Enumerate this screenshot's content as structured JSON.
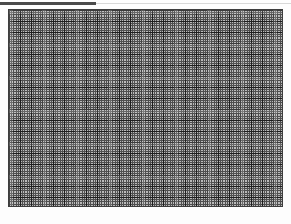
{
  "canvas": {
    "width_px": 291,
    "height_px": 224,
    "background_color": "#fdfdfd",
    "description": "Graph-paper grid pattern"
  },
  "top_rule": {
    "color": "#4a4a4a",
    "faint_color": "#d8d8d8",
    "label": ""
  },
  "grid": {
    "border_color": "#3d3d3d",
    "fill_color": "#b9b9b9",
    "minor_line_color": "#4f4f4f",
    "major_line_color": "#1e1e1e",
    "minor_spacing_px": 2.2,
    "major_spacing_px": 11,
    "left_px": 8,
    "top_px": 9,
    "width_px": 275,
    "height_px": 198,
    "label": ""
  },
  "bottom_margin": {
    "color": "#fdfdfd",
    "label": ""
  }
}
